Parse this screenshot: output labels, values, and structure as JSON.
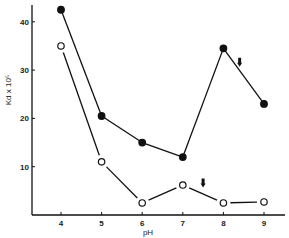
{
  "chart_data": {
    "type": "line",
    "title": "",
    "xlabel": "pH",
    "ylabel": "Kd x 10⁵",
    "x": [
      4,
      5,
      6,
      7,
      8,
      9
    ],
    "xlim": [
      3.3,
      9.5
    ],
    "ylim": [
      0,
      45
    ],
    "x_ticks": [
      "4",
      "5",
      "6",
      "7",
      "8",
      "9"
    ],
    "y_ticks": [
      "10",
      "20",
      "30",
      "40"
    ],
    "grid": false,
    "legend": "none",
    "series": [
      {
        "name": "filled circles",
        "marker": "filled-circle",
        "values": [
          42.5,
          20.5,
          15,
          12,
          34.5,
          23
        ]
      },
      {
        "name": "open circles",
        "marker": "open-circle",
        "values": [
          35,
          11,
          2.5,
          6.2,
          2.5,
          2.7
        ]
      }
    ],
    "annotations": [
      {
        "type": "arrow-down",
        "series": "filled circles",
        "x": 8.4,
        "y": 31.5
      },
      {
        "type": "arrow-down",
        "series": "open circles",
        "x": 7.5,
        "y": 6.5
      }
    ]
  }
}
